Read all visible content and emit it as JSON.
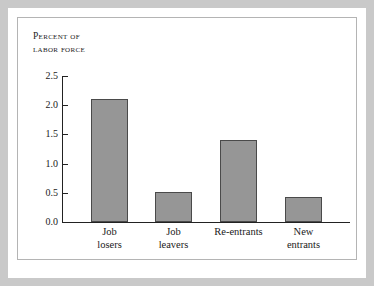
{
  "chart_data": {
    "type": "bar",
    "title": "",
    "ylabel": "Percent of labor force",
    "xlabel": "",
    "ylim": [
      0.0,
      2.5
    ],
    "ytick_labels": [
      "0.0",
      "0.5",
      "1.0",
      "1.5",
      "2.0",
      "2.5"
    ],
    "ytick_values": [
      0.0,
      0.5,
      1.0,
      1.5,
      2.0,
      2.5
    ],
    "grid": false,
    "legend": "none",
    "categories": [
      "Job losers",
      "Job leavers",
      "Re-entrants",
      "New entrants"
    ],
    "values": [
      2.11,
      0.51,
      1.41,
      0.42
    ],
    "bar_color": "#969696",
    "bar_edge_color": "#4a4a4a",
    "axis_color": "#222222"
  },
  "axis_title": {
    "line1": "Percent of",
    "line2": "labor force",
    "text": "Percent of\nlabor force"
  },
  "category_labels": [
    {
      "line1": "Job",
      "line2": "losers",
      "text": "Job\nlosers"
    },
    {
      "line1": "Job",
      "line2": "leavers",
      "text": "Job\nleavers"
    },
    {
      "line1": "Re-entrants",
      "line2": "",
      "text": "Re-entrants"
    },
    {
      "line1": "New",
      "line2": "entrants",
      "text": "New\nentrants"
    }
  ],
  "colors": {
    "outer_band": "#c9c9c9",
    "panel_border": "#b4b4b4",
    "background": "#ffffff",
    "text": "#1a1a1a"
  }
}
